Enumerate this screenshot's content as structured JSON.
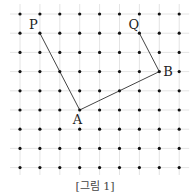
{
  "figure": {
    "caption": "[그림 1]",
    "grid": {
      "columns": 9,
      "rows": 9,
      "x0": 20,
      "dx": 19.9,
      "y0": 14,
      "dy": 19.2,
      "grid_line_color": "#dddddd",
      "dot_color": "#111111"
    },
    "points": [
      {
        "label": "P",
        "col": 1,
        "row": 1,
        "label_dx": -11,
        "label_dy": -4
      },
      {
        "label": "Q",
        "col": 6,
        "row": 1,
        "label_dx": -11,
        "label_dy": -4
      },
      {
        "label": "B",
        "col": 7,
        "row": 3,
        "label_dx": 4,
        "label_dy": 4
      },
      {
        "label": "A",
        "col": 3,
        "row": 5,
        "label_dx": -7,
        "label_dy": 14
      }
    ],
    "segments": [
      {
        "from": "P",
        "to": "A"
      },
      {
        "from": "A",
        "to": "B"
      },
      {
        "from": "B",
        "to": "Q"
      }
    ],
    "line_color": "#444444"
  }
}
